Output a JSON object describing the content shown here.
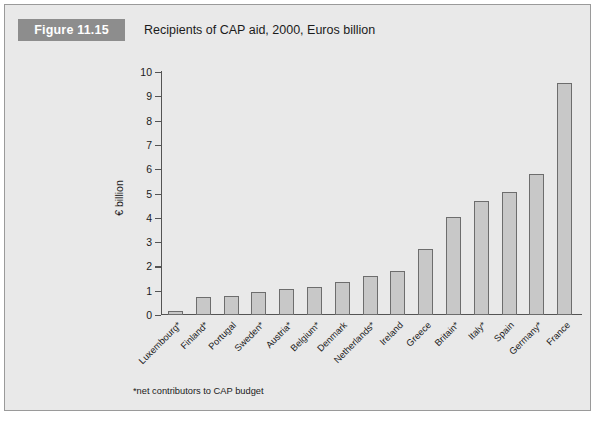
{
  "figure": {
    "number_label": "Figure 11.15",
    "title": "Recipients of CAP aid, 2000, Euros billion",
    "footnote": "*net contributors to CAP budget"
  },
  "colors": {
    "panel_background": "#e9e9e9",
    "panel_border": "#9a9a9a",
    "badge_background": "#8d8d8d",
    "badge_text": "#ffffff",
    "bar_fill": "#c8c8c8",
    "bar_stroke": "#6d6d6d",
    "axis": "#545454",
    "text": "#1b1b1b"
  },
  "chart_data": {
    "type": "bar",
    "title": "Recipients of CAP aid, 2000, Euros billion",
    "xlabel": "",
    "ylabel": "€ billion",
    "ylim": [
      0,
      10
    ],
    "ytick_labels": [
      "10",
      "9",
      "8",
      "7",
      "6",
      "5",
      "4",
      "3",
      "2",
      "1",
      "0"
    ],
    "yticks": [
      10,
      9,
      8,
      7,
      6,
      5,
      4,
      3,
      2,
      1,
      0
    ],
    "grid": false,
    "legend": false,
    "annotations": [
      "*net contributors to CAP budget"
    ],
    "categories": [
      "Luxembourg*",
      "Finland*",
      "Portugal",
      "Sweden*",
      "Austria*",
      "Belgium*",
      "Denmark",
      "Netherlands*",
      "Ireland",
      "Greece",
      "Britain*",
      "Italy*",
      "Spain",
      "Germany*",
      "France"
    ],
    "values": [
      0.15,
      0.75,
      0.8,
      0.95,
      1.05,
      1.15,
      1.35,
      1.6,
      1.8,
      2.7,
      4.05,
      4.7,
      5.05,
      5.8,
      9.55
    ]
  }
}
